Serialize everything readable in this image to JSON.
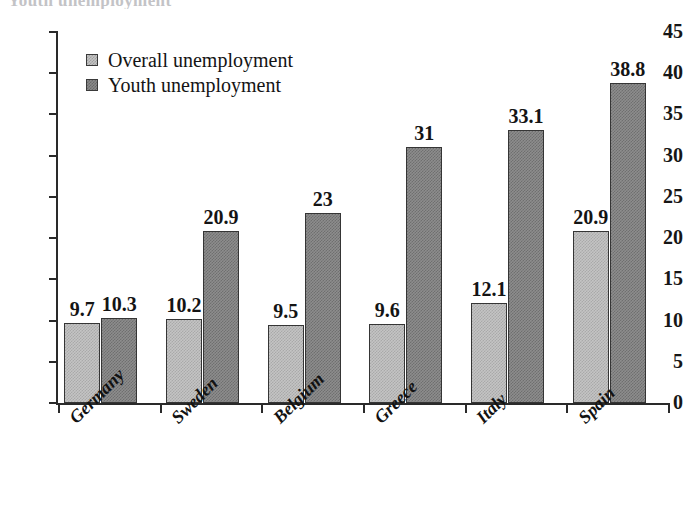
{
  "page": {
    "title_remnant": "Youth unemployment"
  },
  "legend": {
    "position": "inside-top-left",
    "entries": [
      {
        "label": "Overall unemployment",
        "swatch": "light-gray-checker-swatch",
        "color": "#c4c4c4"
      },
      {
        "label": "Youth unemployment",
        "swatch": "dark-gray-checker-swatch",
        "color": "#8d8d8d"
      }
    ]
  },
  "chart_data": {
    "type": "bar",
    "title": "",
    "xlabel": "",
    "ylabel": "",
    "ylim": [
      0,
      45
    ],
    "ytick_step": 5,
    "yticks": [
      "45",
      "40",
      "35",
      "30",
      "25",
      "20",
      "15",
      "10",
      "5",
      "0"
    ],
    "grid": false,
    "legend_position": "inside-top-left",
    "categories": [
      "Germany",
      "Sweden",
      "Belgium",
      "Greece",
      "Italy",
      "Spain"
    ],
    "series": [
      {
        "name": "Overall unemployment",
        "color": "#c4c4c4",
        "values": [
          9.7,
          10.2,
          9.5,
          9.6,
          12.1,
          20.9
        ],
        "labels": [
          "9.7",
          "10.2",
          "9.5",
          "9.6",
          "12.1",
          "20.9"
        ]
      },
      {
        "name": "Youth unemployment",
        "color": "#8d8d8d",
        "values": [
          10.3,
          20.9,
          23,
          31,
          33.1,
          38.8
        ],
        "labels": [
          "10.3",
          "20.9",
          "23",
          "31",
          "33.1",
          "38.8"
        ]
      }
    ]
  }
}
